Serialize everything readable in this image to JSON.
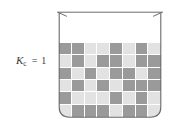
{
  "figure": {
    "kind": "equilibrium-beaker-diagram",
    "background_color": "#ffffff"
  },
  "label": {
    "variable": "K",
    "subscript": "c",
    "equals": "=",
    "value": "1",
    "text_color": "#3a3a3a"
  },
  "beaker": {
    "name": "beaker",
    "outline_color": "#6b6b6b",
    "fill_color": "#ffffff",
    "rim_style": "flared-lip",
    "bottom_style": "rounded-corners"
  },
  "colors": {
    "dark_square": "#9a9a9a",
    "light_square": "#e2e2e2",
    "grid_line": "#ffffff"
  },
  "chart_data": {
    "type": "heatmap",
    "title": "",
    "xlabel": "",
    "ylabel": "",
    "columns": 8,
    "rows": 6,
    "legend": [
      {
        "label": "reactant",
        "value": 0,
        "color": "#9a9a9a"
      },
      {
        "label": "product",
        "value": 1,
        "color": "#e2e2e2"
      }
    ],
    "values": [
      [
        0,
        0,
        1,
        1,
        0,
        1,
        0,
        1
      ],
      [
        1,
        0,
        1,
        0,
        0,
        1,
        0,
        0
      ],
      [
        0,
        1,
        0,
        1,
        0,
        0,
        1,
        0
      ],
      [
        1,
        0,
        1,
        0,
        1,
        0,
        0,
        0
      ],
      [
        0,
        1,
        1,
        1,
        0,
        1,
        0,
        1
      ],
      [
        1,
        0,
        0,
        0,
        1,
        0,
        0,
        1
      ]
    ]
  }
}
